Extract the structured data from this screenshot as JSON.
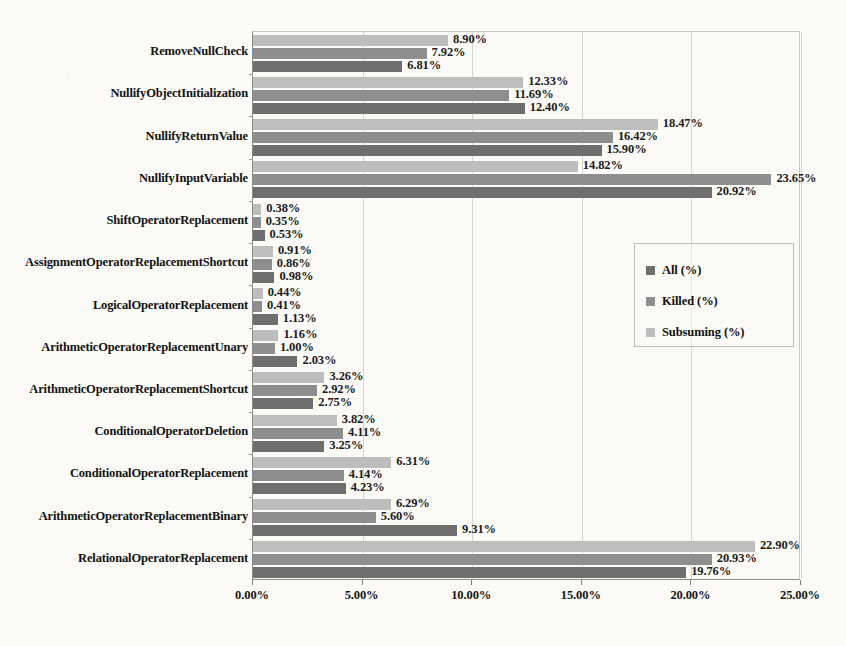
{
  "chart_data": {
    "type": "bar",
    "orientation": "horizontal",
    "title": "",
    "subtitle": "",
    "xlabel": "",
    "ylabel": "",
    "xlim": [
      0,
      25
    ],
    "xticks": [
      "0.00%",
      "5.00%",
      "10.00%",
      "15.00%",
      "20.00%",
      "25.00%"
    ],
    "xtick_values": [
      0,
      5,
      10,
      15,
      20,
      25
    ],
    "grid": true,
    "grid_axis": "x",
    "legend_position": "middle-right-inside",
    "value_label_format": "0.00%",
    "categories": [
      "RemoveNullCheck",
      "NullifyObjectInitialization",
      "NullifyReturnValue",
      "NullifyInputVariable",
      "ShiftOperatorReplacement",
      "AssignmentOperatorReplacementShortcut",
      "LogicalOperatorReplacement",
      "ArithmeticOperatorReplacementUnary",
      "ArithmeticOperatorReplacementShortcut",
      "ConditionalOperatorDeletion",
      "ConditionalOperatorReplacement",
      "ArithmeticOperatorReplacementBinary",
      "RelationalOperatorReplacement"
    ],
    "series": [
      {
        "name": "Subsuming (%)",
        "color": "#bdbdbd",
        "values": [
          8.9,
          12.33,
          18.47,
          14.82,
          0.38,
          0.91,
          0.44,
          1.16,
          3.26,
          3.82,
          6.31,
          6.29,
          22.9
        ],
        "labels": [
          "8.90%",
          "12.33%",
          "18.47%",
          "14.82%",
          "0.38%",
          "0.91%",
          "0.44%",
          "1.16%",
          "3.26%",
          "3.82%",
          "6.31%",
          "6.29%",
          "22.90%"
        ]
      },
      {
        "name": "Killed (%)",
        "color": "#8e8e8e",
        "values": [
          7.92,
          11.69,
          16.42,
          23.65,
          0.35,
          0.86,
          0.41,
          1.0,
          2.92,
          4.11,
          4.14,
          5.6,
          20.93
        ],
        "labels": [
          "7.92%",
          "11.69%",
          "16.42%",
          "23.65%",
          "0.35%",
          "0.86%",
          "0.41%",
          "1.00%",
          "2.92%",
          "4.11%",
          "4.14%",
          "5.60%",
          "20.93%"
        ]
      },
      {
        "name": "All (%)",
        "color": "#6e6e6e",
        "values": [
          6.81,
          12.4,
          15.9,
          20.92,
          0.53,
          0.98,
          1.13,
          2.03,
          2.75,
          3.25,
          4.23,
          9.31,
          19.76
        ],
        "labels": [
          "6.81%",
          "12.40%",
          "15.90%",
          "20.92%",
          "0.53%",
          "0.98%",
          "1.13%",
          "2.03%",
          "2.75%",
          "3.25%",
          "4.23%",
          "9.31%",
          "19.76%"
        ]
      }
    ]
  },
  "legend": {
    "entries": [
      {
        "label": "All (%)",
        "color": "#6e6e6e"
      },
      {
        "label": "Killed (%)",
        "color": "#8e8e8e"
      },
      {
        "label": "Subsuming (%)",
        "color": "#bdbdbd"
      }
    ]
  },
  "colors": {
    "background": "#fbfaf6",
    "axis": "#8a8a8a",
    "gridline": "#d2d2d2",
    "text": "#121212"
  }
}
